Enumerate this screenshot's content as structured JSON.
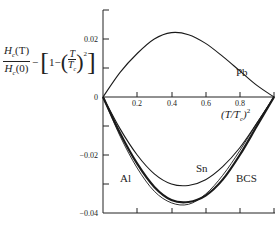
{
  "chart_data": {
    "type": "line",
    "title": "",
    "xlabel": "(T/T_c)^2",
    "ylabel": "H_c(T)/H_c(0) - [1 - (T/T_c)^2]",
    "xlim": [
      0,
      1.0
    ],
    "ylim": [
      -0.04,
      0.03
    ],
    "x_ticks": [
      "0.2",
      "0.4",
      "0.6",
      "0.8"
    ],
    "y_ticks": [
      "0.02",
      "0",
      "-0.02",
      "-0.04"
    ],
    "grid": false,
    "legend": "inline labels",
    "x": [
      0,
      0.1,
      0.2,
      0.3,
      0.4,
      0.5,
      0.6,
      0.7,
      0.8,
      0.9,
      1.0
    ],
    "series": [
      {
        "name": "Pb",
        "values": [
          0,
          0.0085,
          0.015,
          0.02,
          0.0222,
          0.0215,
          0.0185,
          0.014,
          0.009,
          0.004,
          0
        ]
      },
      {
        "name": "Sn",
        "values": [
          0,
          -0.011,
          -0.02,
          -0.0265,
          -0.03,
          -0.0305,
          -0.0285,
          -0.024,
          -0.0175,
          -0.009,
          0
        ]
      },
      {
        "name": "BCS",
        "values": [
          0,
          -0.0125,
          -0.023,
          -0.031,
          -0.0355,
          -0.0362,
          -0.034,
          -0.0285,
          -0.02,
          -0.01,
          0
        ]
      },
      {
        "name": "Al",
        "values": [
          0,
          -0.0135,
          -0.0245,
          -0.0325,
          -0.0365,
          -0.037,
          -0.0335,
          -0.027,
          -0.0185,
          -0.009,
          0
        ]
      }
    ]
  },
  "labels": {
    "y_axis": {
      "frac1_num": "H",
      "frac1_num_sub": "c",
      "frac1_num_arg": "(T)",
      "frac1_den": "H",
      "frac1_den_sub": "c",
      "frac1_den_arg": "(0)",
      "minus": "−",
      "one": "1−",
      "frac2_num": "T",
      "frac2_den": "T",
      "frac2_den_sub": "c",
      "exp": "2"
    },
    "x_axis": {
      "text": "(T/T",
      "sub": "c",
      "close": ")",
      "exp": "2"
    },
    "curves": {
      "pb": "Pb",
      "sn": "Sn",
      "bcs": "BCS",
      "al": "Al"
    },
    "ticks": {
      "x": [
        "0.2",
        "0.4",
        "0.6",
        "0.8"
      ],
      "y": [
        "0.02",
        "0",
        "−0.02",
        "−0.04"
      ]
    }
  }
}
